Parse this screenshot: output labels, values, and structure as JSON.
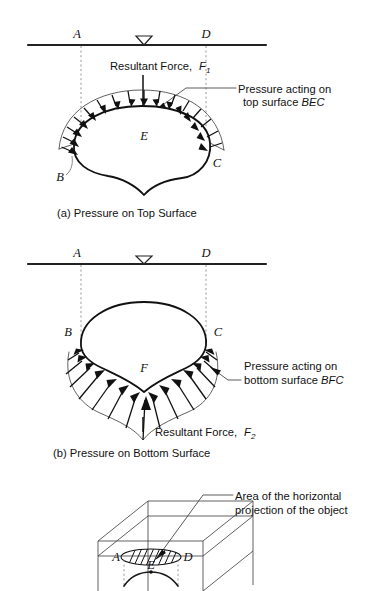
{
  "figure": {
    "panels": [
      {
        "id": "panel-a",
        "caption": "(a) Pressure on Top Surface",
        "surface_labels": {
          "left": "A",
          "right": "D"
        },
        "water_symbol": "water-table-triangle",
        "body_labels": {
          "left": "B",
          "center": "E",
          "right": "C"
        },
        "force_label_main": "Resultant Force,",
        "force_symbol": "F",
        "force_subscript": "1",
        "annotation_line1": "Pressure acting on",
        "annotation_line2_prefix": "top surface ",
        "annotation_line2_italic": "BEC"
      },
      {
        "id": "panel-b",
        "caption": "(b) Pressure on Bottom Surface",
        "surface_labels": {
          "left": "A",
          "right": "D"
        },
        "water_symbol": "water-table-triangle",
        "body_labels": {
          "left": "B",
          "center": "F",
          "right": "C"
        },
        "force_label_main": "Resultant Force,",
        "force_symbol": "F",
        "force_subscript": "2",
        "annotation_line1": "Pressure acting on",
        "annotation_line2_prefix": "bottom surface ",
        "annotation_line2_italic": "BFC"
      },
      {
        "id": "panel-c",
        "annotation_line1": "Area of the horizontal",
        "annotation_line2": "projection of the object",
        "body_labels": {
          "left": "A",
          "right": "D",
          "center": "E"
        }
      }
    ],
    "colors": {
      "ink": "#111111",
      "line": "#444444",
      "dashed": "#8a8a8a",
      "background": "#ffffff"
    }
  }
}
